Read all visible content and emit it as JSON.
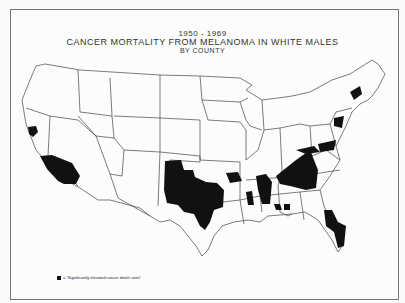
{
  "title": {
    "years": "1950 - 1969",
    "main": "CANCER MORTALITY FROM MELANOMA IN WHITE MALES",
    "sub": "BY COUNTY"
  },
  "legend": {
    "symbol": "black-square",
    "text": "= \"Significantly elevated cancer death rates\""
  },
  "map": {
    "region": "Contiguous United States",
    "unit": "County",
    "fill_color": "#111111",
    "outline_color": "#333333",
    "highlighted_regions": [
      "San Francisco Bay area, CA",
      "Southern California",
      "Western Oklahoma / Texas Panhandle",
      "Central and East Texas",
      "Arkansas",
      "Mississippi / Alabama",
      "Tennessee / Georgia / South Carolina",
      "Virginia / North Carolina",
      "Maryland",
      "New Jersey / New York area",
      "Florida"
    ]
  }
}
